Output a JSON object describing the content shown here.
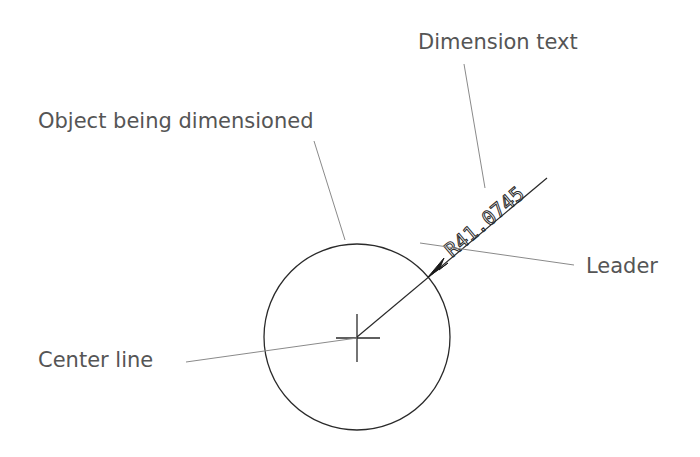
{
  "diagram": {
    "labels": {
      "dimension_text": "Dimension text",
      "object": "Object being dimensioned",
      "leader": "Leader",
      "center_line": "Center line"
    },
    "dimension_value": "R41.0745",
    "colors": {
      "label_text": "#555555",
      "geometry": "#2a2a2a",
      "callout_line": "#888888"
    }
  }
}
